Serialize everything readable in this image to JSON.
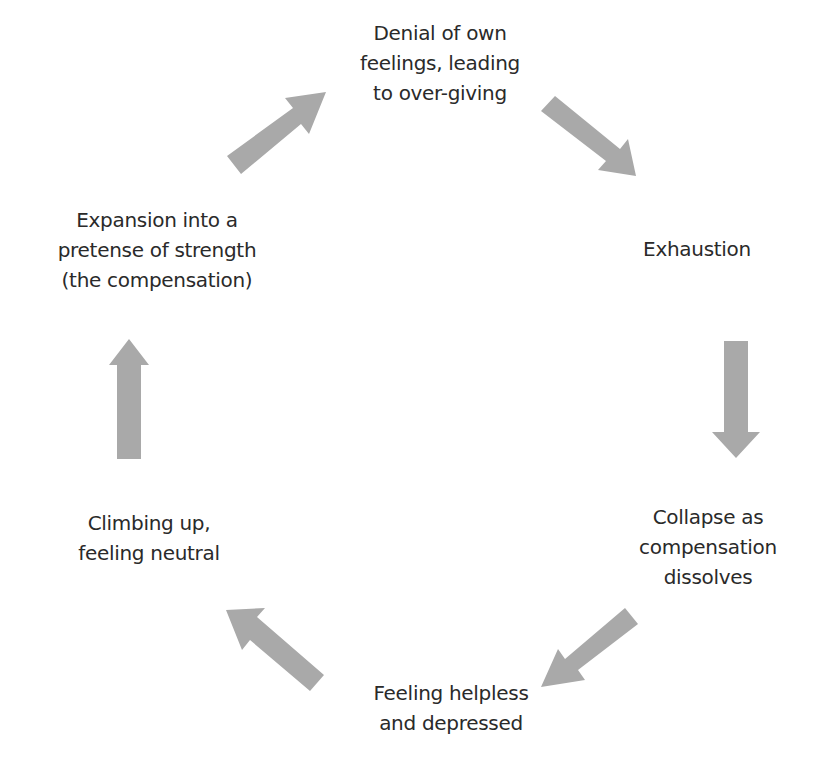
{
  "diagram": {
    "type": "cycle",
    "arrow_color": "#a9a9a9",
    "text_color": "#2a2a2a",
    "nodes": [
      {
        "id": "denial",
        "lines": [
          "Denial of own",
          "feelings, leading",
          "to over-giving"
        ]
      },
      {
        "id": "exhaustion",
        "lines": [
          "Exhaustion"
        ]
      },
      {
        "id": "collapse",
        "lines": [
          "Collapse as",
          "compensation",
          "dissolves"
        ]
      },
      {
        "id": "helpless",
        "lines": [
          "Feeling helpless",
          "and depressed"
        ]
      },
      {
        "id": "climbing",
        "lines": [
          "Climbing up,",
          "feeling neutral"
        ]
      },
      {
        "id": "expansion",
        "lines": [
          "Expansion into a",
          "pretense of strength",
          "(the compensation)"
        ]
      }
    ],
    "edges": [
      {
        "from": "denial",
        "to": "exhaustion",
        "direction": "down-right"
      },
      {
        "from": "exhaustion",
        "to": "collapse",
        "direction": "down"
      },
      {
        "from": "collapse",
        "to": "helpless",
        "direction": "down-left"
      },
      {
        "from": "helpless",
        "to": "climbing",
        "direction": "up-left"
      },
      {
        "from": "climbing",
        "to": "expansion",
        "direction": "up"
      },
      {
        "from": "expansion",
        "to": "denial",
        "direction": "up-right"
      }
    ]
  }
}
